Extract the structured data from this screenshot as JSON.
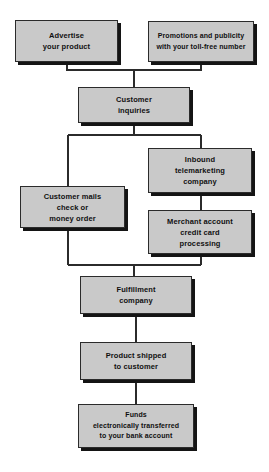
{
  "diagram": {
    "type": "flowchart",
    "orientation": "top-to-bottom",
    "style": {
      "box_fill": "#c9c9c9",
      "box_border": "#2b2b2b",
      "box_shadow": "#141414",
      "line_color": "#2b2b2b",
      "text_color": "#101010",
      "background": "#ffffff"
    },
    "nodes": [
      {
        "id": "advertise",
        "label": "Advertise\nyour product",
        "x": 15,
        "y": 20,
        "width": 103,
        "height": 42
      },
      {
        "id": "promotions",
        "label": "Promotions and publicity\nwith your toll-free number",
        "x": 148,
        "y": 21,
        "width": 106,
        "height": 41
      },
      {
        "id": "customer-inquiries",
        "label": "Customer\ninquiries",
        "x": 78,
        "y": 87,
        "width": 112,
        "height": 36
      },
      {
        "id": "inbound-telemarketing",
        "label": "Inbound\ntelemarketing\ncompany",
        "x": 148,
        "y": 148,
        "width": 104,
        "height": 45
      },
      {
        "id": "customer-mails",
        "label": "Customer mails\ncheck or\nmoney order",
        "x": 20,
        "y": 186,
        "width": 105,
        "height": 42
      },
      {
        "id": "merchant-account",
        "label": "Merchant account\ncredit card\nprocessing",
        "x": 148,
        "y": 210,
        "width": 104,
        "height": 44
      },
      {
        "id": "fulfillment",
        "label": "Fulfillment\ncompany",
        "x": 80,
        "y": 276,
        "width": 112,
        "height": 38
      },
      {
        "id": "product-shipped",
        "label": "Product shipped\nto customer",
        "x": 80,
        "y": 342,
        "width": 112,
        "height": 38
      },
      {
        "id": "funds-transferred",
        "label": "Funds\nelectronically transferred\nto your bank account",
        "x": 78,
        "y": 404,
        "width": 116,
        "height": 44
      }
    ],
    "edges": [
      {
        "id": "advertise-to-inquiries",
        "from": "advertise",
        "to": "customer-inquiries"
      },
      {
        "id": "promotions-to-inquiries",
        "from": "promotions",
        "to": "customer-inquiries"
      },
      {
        "id": "inquiries-to-customer-mails",
        "from": "customer-inquiries",
        "to": "customer-mails"
      },
      {
        "id": "inquiries-to-inbound-telemarketing",
        "from": "customer-inquiries",
        "to": "inbound-telemarketing"
      },
      {
        "id": "inbound-to-merchant",
        "from": "inbound-telemarketing",
        "to": "merchant-account"
      },
      {
        "id": "customer-mails-to-fulfillment",
        "from": "customer-mails",
        "to": "fulfillment"
      },
      {
        "id": "merchant-to-fulfillment",
        "from": "merchant-account",
        "to": "fulfillment"
      },
      {
        "id": "fulfillment-to-shipped",
        "from": "fulfillment",
        "to": "product-shipped"
      },
      {
        "id": "shipped-to-funds",
        "from": "product-shipped",
        "to": "funds-transferred"
      }
    ]
  }
}
